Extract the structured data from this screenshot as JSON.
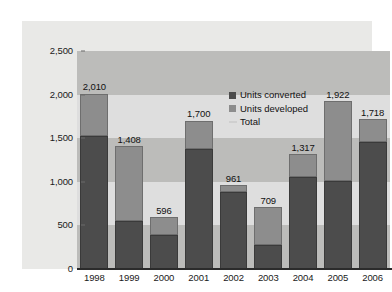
{
  "chart_data": {
    "type": "bar",
    "stacked": true,
    "title": "",
    "subtitle": "",
    "xlabel": "",
    "ylabel": "",
    "categories": [
      "1998",
      "1999",
      "2000",
      "2001",
      "2002",
      "2003",
      "2004",
      "2005",
      "2006"
    ],
    "series": [
      {
        "name": "Units converted",
        "color": "#4c4c4c",
        "values": [
          1520,
          550,
          390,
          1380,
          880,
          270,
          1055,
          1010,
          1460
        ]
      },
      {
        "name": "Units developed",
        "color": "#8d8d8d",
        "values": [
          490,
          858,
          206,
          320,
          81,
          439,
          262,
          912,
          258
        ]
      }
    ],
    "totals": [
      2010,
      1408,
      596,
      1700,
      961,
      709,
      1317,
      1922,
      1718
    ],
    "total_labels": [
      "2,010",
      "1,408",
      "596",
      "1,700",
      "961",
      "709",
      "1,317",
      "1,922",
      "1,718"
    ],
    "ylim": [
      0,
      2500
    ],
    "ytick_values": [
      0,
      500,
      1000,
      1500,
      2000,
      2500
    ],
    "ytick_labels": [
      "0",
      "500",
      "1,000",
      "1,500",
      "2,000",
      "2,500"
    ],
    "grid": false,
    "banded_background": true,
    "band_colors": [
      "#bcbcba",
      "#dedede"
    ],
    "legend_position": "inside-upper-center",
    "legend": [
      {
        "label": "Units converted",
        "marker": "square",
        "color": "#4c4c4c"
      },
      {
        "label": "Units developed",
        "marker": "square",
        "color": "#8d8d8d"
      },
      {
        "label": "Total",
        "marker": "line",
        "color": "#cfcfcf"
      }
    ]
  }
}
